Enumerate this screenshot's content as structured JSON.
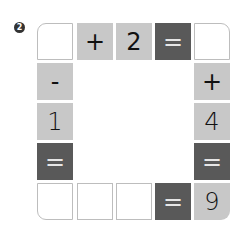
{
  "problem_number": "2",
  "colors": {
    "blank": "#ffffff",
    "light": "#c8c8c8",
    "dark": "#595959",
    "border": "#bdbdbd"
  },
  "grid": {
    "top_row": [
      "",
      "+",
      "2",
      "=",
      ""
    ],
    "left_col": [
      "-",
      "1",
      "="
    ],
    "right_col": [
      "+",
      "4",
      "="
    ],
    "bottom_row": [
      "",
      "",
      "",
      "=",
      "9"
    ]
  }
}
